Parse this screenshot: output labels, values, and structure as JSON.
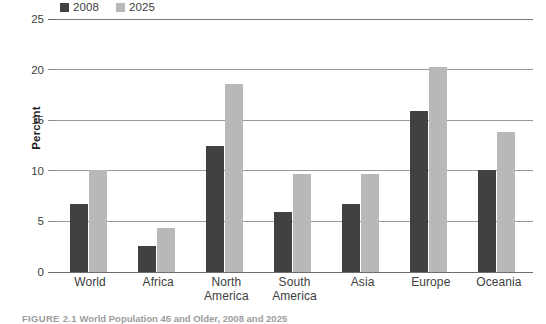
{
  "figure": {
    "caption_prefix": "FIGURE 2.1",
    "caption_title": "World Population 45 and Older, 2008 and 2025"
  },
  "legend": {
    "position": "top-left",
    "items": [
      {
        "label": "2008",
        "color": "#414141",
        "swatch_name": "legend-swatch-2008"
      },
      {
        "label": "2025",
        "color": "#b8b8b8",
        "swatch_name": "legend-swatch-2025"
      }
    ]
  },
  "axis": {
    "y_title": "Percent",
    "y_ticks": [
      "0",
      "5",
      "10",
      "15",
      "20",
      "25"
    ]
  },
  "colors": {
    "series_2008": "#414141",
    "series_2025": "#b8b8b8",
    "gridline": "#9a9a9a",
    "axis_text": "#3d3d3d",
    "caption_text": "#9c9c9c",
    "background": "#ffffff"
  },
  "chart_data": {
    "type": "bar",
    "title": "World Population 45 and Older, 2008 and 2025",
    "xlabel": "",
    "ylabel": "Percent",
    "ylim": [
      0,
      25
    ],
    "yticks": [
      0,
      5,
      10,
      15,
      20,
      25
    ],
    "grid": true,
    "legend_position": "top-left",
    "categories": [
      "World",
      "Africa",
      "North America",
      "South America",
      "Asia",
      "Europe",
      "Oceania"
    ],
    "series": [
      {
        "name": "2008",
        "color": "#414141",
        "values": [
          6.7,
          2.6,
          12.5,
          5.9,
          6.7,
          15.9,
          10.1
        ]
      },
      {
        "name": "2025",
        "color": "#b8b8b8",
        "values": [
          10.1,
          4.3,
          18.6,
          9.7,
          9.7,
          20.3,
          13.8
        ]
      }
    ]
  }
}
